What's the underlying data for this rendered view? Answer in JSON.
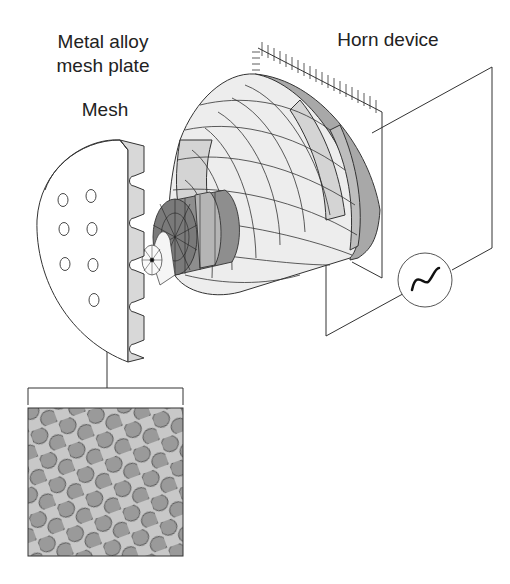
{
  "labels": {
    "metal_alloy_line1": "Metal alloy",
    "metal_alloy_line2": "mesh plate",
    "mesh": "Mesh",
    "horn_device": "Horn device"
  },
  "components": {
    "mesh_plate": {
      "hole_count": 8,
      "tooth_count": 5
    },
    "horn": {
      "type": "ultrasonic horn, finite element mesh"
    },
    "ac_source": {
      "symbol": "~"
    },
    "mesh_detail": {
      "pattern": "hexagonal perforation"
    }
  },
  "colors": {
    "line": "#333333",
    "light_fill": "#f2f2f2",
    "mid_fill": "#d4d4d4",
    "dark_fill": "#a8a8a8",
    "mesh_bg": "#c8c8c8",
    "mesh_hole": "#9a9a9a"
  }
}
